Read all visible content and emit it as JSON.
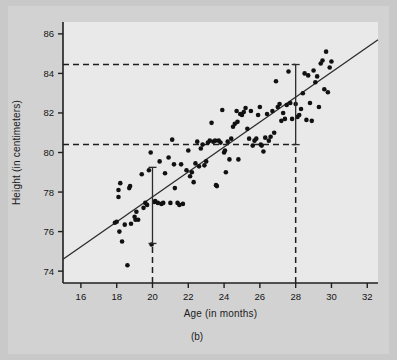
{
  "figure": {
    "caption": "(b)",
    "background_color": "#c9c9c9",
    "panel_color": "#e9e9e9"
  },
  "chart_data": {
    "type": "scatter",
    "title": "",
    "xlabel": "Age (in months)",
    "ylabel": "Height (in centimeters)",
    "xlim": [
      15,
      32.6
    ],
    "ylim": [
      73.4,
      86.6
    ],
    "xticks": [
      16,
      18,
      20,
      22,
      24,
      26,
      28,
      30,
      32
    ],
    "yticks": [
      74,
      76,
      78,
      80,
      82,
      84,
      86
    ],
    "grid": false,
    "legend": null,
    "point_color": "#111111",
    "line_color": "#2b2b2b",
    "regression_line": {
      "label": "least-squares regression line",
      "x": [
        15,
        32.6
      ],
      "y": [
        74.6,
        85.7
      ],
      "slope": 0.63,
      "intercept": 65.15
    },
    "reference_lines": [
      {
        "name": "upper-horizontal-dashed",
        "orientation": "horizontal",
        "y": 84.45,
        "x_start": 15,
        "x_end": 28
      },
      {
        "name": "lower-horizontal-dashed",
        "orientation": "horizontal",
        "y": 80.4,
        "x_start": 15,
        "x_end": 28
      },
      {
        "name": "vertical-dashed-at-20",
        "orientation": "vertical",
        "x": 20,
        "y_start": 73.4,
        "y_end": 75.4
      },
      {
        "name": "vertical-dashed-at-28",
        "orientation": "vertical",
        "x": 28,
        "y_start": 73.4,
        "y_end": 80.4
      }
    ],
    "error_bars": [
      {
        "name": "prediction-interval-at-age-20",
        "x": 20,
        "center": 77.5,
        "low": 75.4,
        "high": 79.25
      },
      {
        "name": "prediction-interval-at-age-28",
        "x": 28,
        "center": 82.45,
        "low": 80.4,
        "high": 84.45
      }
    ],
    "points": [
      [
        17.9,
        76.45
      ],
      [
        18.0,
        76.5
      ],
      [
        18.1,
        78.1
      ],
      [
        18.1,
        77.75
      ],
      [
        18.15,
        76.0
      ],
      [
        18.2,
        78.45
      ],
      [
        18.3,
        75.5
      ],
      [
        18.45,
        76.35
      ],
      [
        18.6,
        74.3
      ],
      [
        18.7,
        78.2
      ],
      [
        18.75,
        78.3
      ],
      [
        18.8,
        76.4
      ],
      [
        19.0,
        76.75
      ],
      [
        19.05,
        76.6
      ],
      [
        19.1,
        77.0
      ],
      [
        19.2,
        76.6
      ],
      [
        19.4,
        78.9
      ],
      [
        19.5,
        77.2
      ],
      [
        19.6,
        77.45
      ],
      [
        19.7,
        77.35
      ],
      [
        19.8,
        79.1
      ],
      [
        19.9,
        80.0
      ],
      [
        19.95,
        75.35
      ],
      [
        20.1,
        77.5
      ],
      [
        20.15,
        77.55
      ],
      [
        20.3,
        77.45
      ],
      [
        20.4,
        79.55
      ],
      [
        20.5,
        77.4
      ],
      [
        20.6,
        77.45
      ],
      [
        20.7,
        78.95
      ],
      [
        20.9,
        79.75
      ],
      [
        21.0,
        77.45
      ],
      [
        21.1,
        80.65
      ],
      [
        21.2,
        79.4
      ],
      [
        21.25,
        78.2
      ],
      [
        21.4,
        77.45
      ],
      [
        21.5,
        77.35
      ],
      [
        21.6,
        79.4
      ],
      [
        21.7,
        77.4
      ],
      [
        21.9,
        79.1
      ],
      [
        22.0,
        80.1
      ],
      [
        22.1,
        78.8
      ],
      [
        22.2,
        79.0
      ],
      [
        22.3,
        78.5
      ],
      [
        22.4,
        79.45
      ],
      [
        22.5,
        80.55
      ],
      [
        22.6,
        79.3
      ],
      [
        22.7,
        80.2
      ],
      [
        22.8,
        80.4
      ],
      [
        22.9,
        79.35
      ],
      [
        23.0,
        79.55
      ],
      [
        23.1,
        80.5
      ],
      [
        23.2,
        80.6
      ],
      [
        23.3,
        81.5
      ],
      [
        23.4,
        80.55
      ],
      [
        23.5,
        80.6
      ],
      [
        23.55,
        78.35
      ],
      [
        23.6,
        78.3
      ],
      [
        23.7,
        80.6
      ],
      [
        23.8,
        80.5
      ],
      [
        23.9,
        82.15
      ],
      [
        24.0,
        80.0
      ],
      [
        24.05,
        80.1
      ],
      [
        24.1,
        79.0
      ],
      [
        24.2,
        80.55
      ],
      [
        24.3,
        79.65
      ],
      [
        24.4,
        80.7
      ],
      [
        24.5,
        81.3
      ],
      [
        24.6,
        81.45
      ],
      [
        24.7,
        82.1
      ],
      [
        24.75,
        81.55
      ],
      [
        24.8,
        79.65
      ],
      [
        24.9,
        81.95
      ],
      [
        25.0,
        81.9
      ],
      [
        25.1,
        82.05
      ],
      [
        25.2,
        82.25
      ],
      [
        25.3,
        81.2
      ],
      [
        25.4,
        80.7
      ],
      [
        25.5,
        82.1
      ],
      [
        25.6,
        80.35
      ],
      [
        25.7,
        80.6
      ],
      [
        25.8,
        80.7
      ],
      [
        25.9,
        81.9
      ],
      [
        26.0,
        82.3
      ],
      [
        26.05,
        80.4
      ],
      [
        26.1,
        80.35
      ],
      [
        26.2,
        80.05
      ],
      [
        26.3,
        80.75
      ],
      [
        26.4,
        81.95
      ],
      [
        26.5,
        80.6
      ],
      [
        26.6,
        80.8
      ],
      [
        26.7,
        82.1
      ],
      [
        26.8,
        81.0
      ],
      [
        26.9,
        83.6
      ],
      [
        27.0,
        82.3
      ],
      [
        27.1,
        82.45
      ],
      [
        27.2,
        81.6
      ],
      [
        27.3,
        82.0
      ],
      [
        27.4,
        81.7
      ],
      [
        27.5,
        82.4
      ],
      [
        27.6,
        84.1
      ],
      [
        27.7,
        82.5
      ],
      [
        27.8,
        81.7
      ],
      [
        28.0,
        82.45
      ],
      [
        28.1,
        81.8
      ],
      [
        28.2,
        81.9
      ],
      [
        28.3,
        82.2
      ],
      [
        28.4,
        83.0
      ],
      [
        28.5,
        84.0
      ],
      [
        28.6,
        81.65
      ],
      [
        28.7,
        83.9
      ],
      [
        28.8,
        82.5
      ],
      [
        28.9,
        81.6
      ],
      [
        29.0,
        84.15
      ],
      [
        29.1,
        83.55
      ],
      [
        29.2,
        83.85
      ],
      [
        29.3,
        82.3
      ],
      [
        29.4,
        84.5
      ],
      [
        29.5,
        84.65
      ],
      [
        29.6,
        83.2
      ],
      [
        29.7,
        85.1
      ],
      [
        29.8,
        83.05
      ],
      [
        29.9,
        84.3
      ],
      [
        30.0,
        84.6
      ]
    ]
  }
}
